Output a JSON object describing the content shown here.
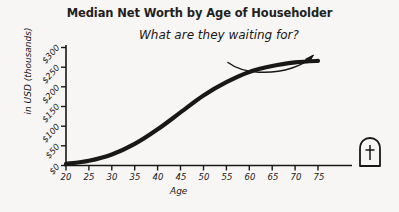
{
  "chart_data": {
    "type": "line",
    "title": "Median Net Worth by Age of Householder",
    "xlabel": "Age",
    "ylabel": "in USD (thousands)",
    "x": [
      20,
      25,
      30,
      35,
      40,
      45,
      50,
      55,
      60,
      65,
      70,
      75
    ],
    "values": [
      4,
      12,
      28,
      55,
      92,
      135,
      178,
      212,
      238,
      253,
      262,
      266
    ],
    "xlim": [
      20,
      75
    ],
    "ylim": [
      0,
      300
    ],
    "xticks": [
      "20",
      "25",
      "30",
      "35",
      "40",
      "45",
      "50",
      "55",
      "60",
      "65",
      "70",
      "75"
    ],
    "yticks": [
      "$0",
      "$50",
      "$100",
      "$150",
      "$200",
      "$250",
      "$300"
    ],
    "ytick_values": [
      0,
      50,
      100,
      150,
      200,
      250,
      300
    ],
    "grid": false,
    "legend": "none",
    "series_color": "#1a1717",
    "background_color": "#f7f6f4",
    "annotations": [
      {
        "text": "What are they waiting for?",
        "name": "handwritten-annotation",
        "arrow": "curved-arrow-pointing-right-to-curve-end"
      },
      {
        "name": "tombstone-marker",
        "text": "",
        "description": "gravestone-with-cross-at-end-of-age-axis"
      }
    ]
  },
  "axis": {
    "y_title": "in USD (thousands)",
    "x_title": "Age"
  }
}
